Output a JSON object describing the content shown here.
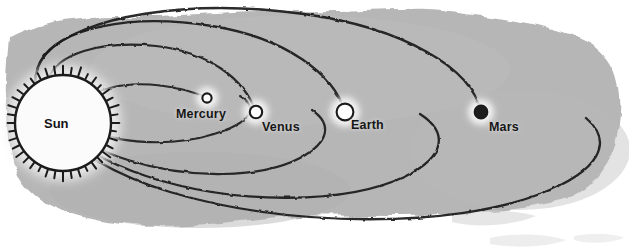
{
  "figure": {
    "kind": "diagram",
    "background_color": "#b6b6b6",
    "page_color": "#ffffff",
    "ink_color": "#1b1b1b"
  },
  "sun": {
    "label": "Sun",
    "cx": 63,
    "cy": 123,
    "r": 48,
    "fill": "#fbfbfb",
    "ray_count": 40,
    "label_x": 44,
    "label_y": 116
  },
  "planets": [
    {
      "name": "Mercury",
      "label": "Mercury",
      "cx": 207,
      "cy": 98,
      "r": 4.6,
      "style": "open",
      "fill": "#ffffff",
      "label_x": 176,
      "label_y": 107
    },
    {
      "name": "Venus",
      "label": "Venus",
      "cx": 256,
      "cy": 112,
      "r": 6.2,
      "style": "open",
      "fill": "#ffffff",
      "label_x": 262,
      "label_y": 120
    },
    {
      "name": "Earth",
      "label": "Earth",
      "cx": 345,
      "cy": 112,
      "r": 8.4,
      "style": "open",
      "fill": "#ffffff",
      "label_x": 351,
      "label_y": 118
    },
    {
      "name": "Mars",
      "label": "Mars",
      "cx": 481,
      "cy": 112,
      "r": 6.6,
      "style": "filled",
      "fill": "#1d1d1d",
      "label_x": 489,
      "label_y": 120
    }
  ],
  "orbits": [
    {
      "name": "mercury-orbit",
      "rx": 85,
      "ry": 42,
      "cx": 136,
      "cy": 111
    },
    {
      "name": "venus-orbit",
      "rx": 175,
      "ry": 74,
      "cx": 222,
      "cy": 109
    },
    {
      "name": "earth-orbit",
      "rx": 272,
      "ry": 104,
      "cx": 318,
      "cy": 110
    },
    {
      "name": "mars-orbit",
      "rx": 410,
      "ry": 140,
      "cx": 452,
      "cy": 110
    }
  ],
  "chart_data": {
    "type": "diagram",
    "bodies": [
      "Sun",
      "Mercury",
      "Venus",
      "Earth",
      "Mars"
    ],
    "marker_styles": [
      "rayed-disc",
      "open-circle",
      "open-circle",
      "open-circle",
      "filled-circle"
    ],
    "orbit_count": 4,
    "note": "Concentric elliptical orbits centered on the Sun at left; arcs run off the right edge"
  }
}
